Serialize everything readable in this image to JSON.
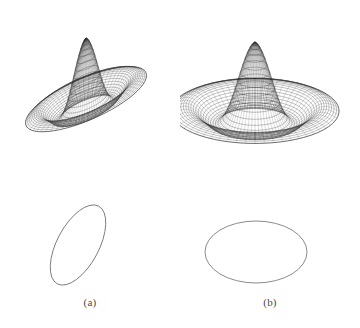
{
  "figure": {
    "background_color": "#ffffff",
    "line_color": "#2b2b2b",
    "ellipse_color": "#6d6d6d",
    "caption_color": "#4a4a4a",
    "width": 360,
    "height": 328
  },
  "panels": [
    {
      "id": "a",
      "caption": "(a)",
      "surface": {
        "name": "tilted-anisotropic-psf-surface",
        "center_x": 86,
        "center_y": 100,
        "scale_x": 72,
        "scale_y": 66,
        "rotation_deg": -36,
        "aspect": 0.42,
        "tilt_deg": 62,
        "height_scale": 62,
        "rings": 34,
        "spokes": 56,
        "ripple_lobes": 2.2,
        "peak_count": 4
      },
      "footprint": {
        "name": "tilted-ellipse-footprint",
        "cx": 78,
        "cy": 245,
        "rx": 21,
        "ry": 44,
        "rotation_deg": 28
      }
    },
    {
      "id": "b",
      "caption": "(b)",
      "surface": {
        "name": "isotropic-psf-surface",
        "center_x": 75,
        "center_y": 112,
        "scale_x": 84,
        "scale_y": 68,
        "rotation_deg": 0,
        "aspect": 0.62,
        "tilt_deg": 58,
        "height_scale": 70,
        "rings": 34,
        "spokes": 56,
        "ripple_lobes": 2.2,
        "peak_count": 4
      },
      "footprint": {
        "name": "horizontal-ellipse-footprint",
        "cx": 76,
        "cy": 252,
        "rx": 51,
        "ry": 31,
        "rotation_deg": 0
      }
    }
  ],
  "chart_data": {
    "type": "line",
    "title": "",
    "xlabel": "",
    "ylabel": "",
    "legend": [],
    "annotations": [
      "(a)",
      "(b)"
    ],
    "series": [
      {
        "name": "panel-a-surface",
        "radial_profile_r": [
          0.0,
          0.1,
          0.2,
          0.3,
          0.4,
          0.5,
          0.6,
          0.7,
          0.8,
          0.9,
          1.0
        ],
        "radial_profile_z": [
          1.0,
          0.93,
          0.74,
          0.49,
          0.24,
          0.05,
          -0.04,
          -0.05,
          0.02,
          0.1,
          0.14
        ]
      },
      {
        "name": "panel-b-surface",
        "radial_profile_r": [
          0.0,
          0.1,
          0.2,
          0.3,
          0.4,
          0.5,
          0.6,
          0.7,
          0.8,
          0.9,
          1.0
        ],
        "radial_profile_z": [
          1.0,
          0.93,
          0.74,
          0.49,
          0.24,
          0.05,
          -0.04,
          -0.05,
          0.02,
          0.1,
          0.14
        ]
      }
    ],
    "ylim": [
      -0.2,
      1.0
    ],
    "grid": false,
    "legend_position": "none"
  }
}
